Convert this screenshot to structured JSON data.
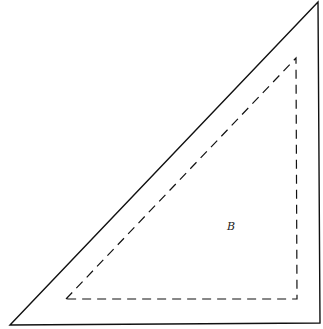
{
  "diagram": {
    "outer_triangle": {
      "points": [
        [
          10,
          325
        ],
        [
          318,
          2
        ],
        [
          320,
          323
        ]
      ],
      "stroke": "#111111",
      "style": "solid"
    },
    "inner_triangle": {
      "points": [
        [
          66,
          299
        ],
        [
          296,
          58
        ],
        [
          297,
          299
        ]
      ],
      "stroke": "#111111",
      "style": "dashed"
    },
    "label": {
      "text": "B",
      "x": 228,
      "y": 222
    }
  }
}
